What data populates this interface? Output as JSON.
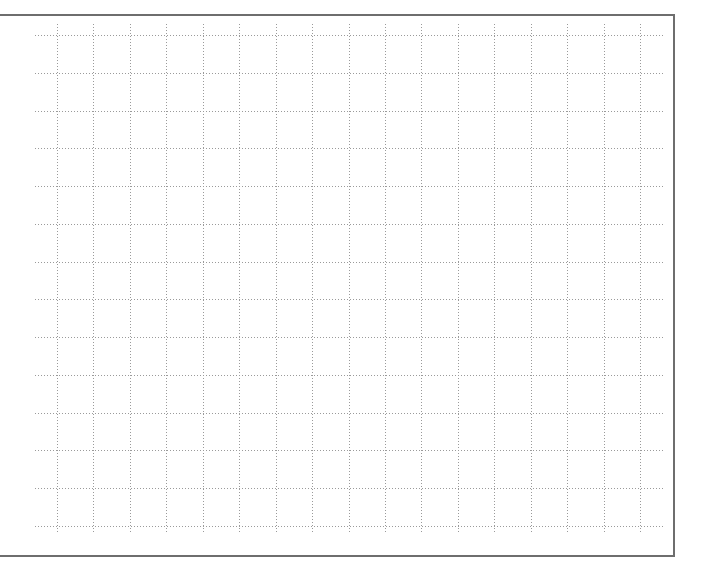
{
  "grid": {
    "line_style": "dotted",
    "line_color": "#9a9a9a",
    "border_color": "#6e6e6e",
    "horizontal_line_count": 14,
    "vertical_line_count": 17
  }
}
